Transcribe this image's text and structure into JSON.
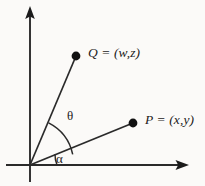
{
  "figure": {
    "type": "geometry-diagram",
    "background_color": "#fbfaf8",
    "ink_color": "#1b1b1b",
    "axes": {
      "origin": {
        "x": 30,
        "y": 165
      },
      "y_axis": {
        "x": 30,
        "y_top": 8,
        "y_bottom": 182,
        "arrow": "up",
        "arrow_tip": {
          "x": 30,
          "y": 8
        }
      },
      "x_axis": {
        "y": 165,
        "x_left": 6,
        "x_right": 188,
        "arrow": "right",
        "arrow_tip": {
          "x": 188,
          "y": 165
        }
      }
    },
    "points": [
      {
        "name": "Q",
        "label": "Q = (w,z)",
        "dot": {
          "x": 76,
          "y": 56
        },
        "label_pos": {
          "x": 88,
          "y": 45
        },
        "ray_from_origin": true
      },
      {
        "name": "P",
        "label": "P = (x,y)",
        "dot": {
          "x": 133,
          "y": 123
        },
        "label_pos": {
          "x": 145,
          "y": 112
        },
        "ray_from_origin": true
      }
    ],
    "angles": [
      {
        "name": "theta",
        "label": "θ",
        "between": [
          "ray-OP",
          "ray-OQ"
        ],
        "arc_radius": 46,
        "label_pos": {
          "x": 67,
          "y": 108
        }
      },
      {
        "name": "alpha",
        "label": "α",
        "between": [
          "x-axis",
          "ray-OP"
        ],
        "arc_radius": 27,
        "label_pos": {
          "x": 56,
          "y": 151
        }
      }
    ]
  }
}
